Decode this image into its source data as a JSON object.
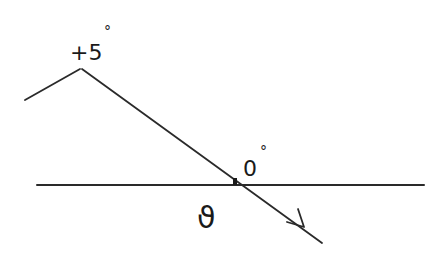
{
  "diagram": {
    "type": "hand-drawn angle diagram",
    "labels": {
      "top_angle": "+5",
      "top_angle_degree": "°",
      "crossing_angle": "0",
      "crossing_angle_degree": "°",
      "angle_symbol": "ϑ"
    },
    "colors": {
      "stroke": "#2a2a2a",
      "background": "#ffffff"
    },
    "elements": [
      {
        "name": "baseline",
        "kind": "horizontal line"
      },
      {
        "name": "inclined-ray",
        "kind": "line with arrow",
        "direction": "down-right"
      },
      {
        "name": "left-segment",
        "kind": "line"
      },
      {
        "name": "intersection-point",
        "kind": "dot"
      }
    ]
  }
}
